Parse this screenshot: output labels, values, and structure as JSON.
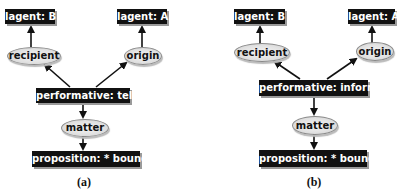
{
  "panels": [
    {
      "id": "a",
      "caption": "(a)",
      "nodes": {
        "agent_b": "lagent: B",
        "agent_a": "lagent: A",
        "recipient": "recipient",
        "origin": "origin",
        "performative": "performative: tell",
        "matter": "matter",
        "proposition": "proposition: * bound"
      }
    },
    {
      "id": "b",
      "caption": "(b)",
      "nodes": {
        "agent_b": "lagent: B",
        "agent_a": "lagent: A",
        "recipient": "recipient",
        "origin": "origin",
        "performative": "performative: inform",
        "matter": "matter",
        "proposition": "proposition: * bound"
      }
    }
  ],
  "edges": [
    {
      "from": "performative",
      "to": "recipient"
    },
    {
      "from": "performative",
      "to": "origin"
    },
    {
      "from": "recipient",
      "to": "agent_b"
    },
    {
      "from": "origin",
      "to": "agent_a"
    },
    {
      "from": "performative",
      "to": "matter"
    },
    {
      "from": "matter",
      "to": "proposition"
    }
  ]
}
